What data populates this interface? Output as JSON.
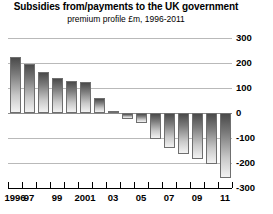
{
  "chart_data": {
    "type": "bar",
    "title": "Subsidies from/payments to the UK government",
    "subtitle": "premium profile £m, 1996-2011",
    "xlabel": "",
    "ylabel": "",
    "ylim": [
      -300,
      300
    ],
    "yticks": [
      300,
      200,
      100,
      0,
      -100,
      -200,
      -300
    ],
    "ytick_labels": [
      "300",
      "200",
      "100",
      "0",
      "-100",
      "-200",
      "-300"
    ],
    "grid": true,
    "legend": "none",
    "categories": [
      "1996",
      "1997",
      "1998",
      "1999",
      "2000",
      "2001",
      "2002",
      "2003",
      "2004",
      "2005",
      "2006",
      "2007",
      "2008",
      "2009",
      "2010",
      "2011"
    ],
    "xtick_labels": [
      "1996",
      "97",
      "",
      "99",
      "",
      "2001",
      "",
      "03",
      "",
      "05",
      "",
      "07",
      "",
      "09",
      "",
      "11"
    ],
    "values": [
      225,
      195,
      165,
      140,
      130,
      125,
      60,
      10,
      -25,
      -40,
      -105,
      -140,
      -165,
      -185,
      -205,
      -260
    ]
  }
}
